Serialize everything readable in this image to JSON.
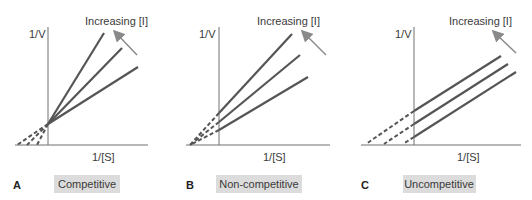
{
  "figure": {
    "panels": [
      {
        "letter": "A",
        "title": "Competitive",
        "y_axis_label": "1/V",
        "x_axis_label": "1/[S]",
        "arrow_label": "Increasing [I]",
        "description": "Lines intersect on the y-axis; slope increases with [I]"
      },
      {
        "letter": "B",
        "title": "Non-competitive",
        "y_axis_label": "1/V",
        "x_axis_label": "1/[S]",
        "arrow_label": "Increasing [I]",
        "description": "Lines intersect on the x-axis; y-intercept increases with [I]"
      },
      {
        "letter": "C",
        "title": "Uncompetitive",
        "y_axis_label": "1/V",
        "x_axis_label": "1/[S]",
        "arrow_label": "Increasing [I]",
        "description": "Parallel lines; both intercepts shift with [I]"
      }
    ]
  },
  "colors": {
    "line": "#555555",
    "axis": "#707070",
    "arrow": "#8a8a8a",
    "title_box": "#dcdcdc",
    "text": "#3a3a3a"
  }
}
